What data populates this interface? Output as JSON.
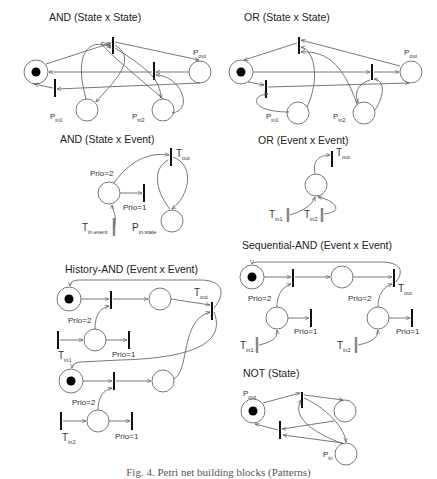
{
  "figure": {
    "caption": "Fig. 4. Petri net building blocks (Patterns)",
    "colors": {
      "stroke": "#555555",
      "token": "#000000",
      "background": "#ffffff"
    }
  },
  "panels": {
    "and_state_state": {
      "title": "AND (State x State)",
      "labels": {
        "p_out": "P",
        "p_out_sub": "out",
        "p_in1": "P",
        "p_in1_sub": "in1",
        "p_in2": "P",
        "p_in2_sub": "in2"
      }
    },
    "or_state_state": {
      "title": "OR (State x State)",
      "labels": {
        "p_out": "P",
        "p_out_sub": "out",
        "p_in1": "P",
        "p_in1_sub": "in1",
        "p_in2": "P",
        "p_in2_sub": "in2"
      }
    },
    "and_state_event": {
      "title": "AND (State x Event)",
      "labels": {
        "t_out": "T",
        "t_out_sub": "out",
        "prio2": "Prio=2",
        "prio1": "Prio=1",
        "t_in_event": "T",
        "t_in_event_sub": "in.event",
        "p_in_state": "P",
        "p_in_state_sub": "in.state"
      }
    },
    "or_event_event": {
      "title": "OR (Event x Event)",
      "labels": {
        "t_out": "T",
        "t_out_sub": "out",
        "t_in1": "T",
        "t_in1_sub": "in1",
        "t_in2": "T",
        "t_in2_sub": "in2"
      }
    },
    "history_and": {
      "title": "History-AND (Event x Event)",
      "labels": {
        "t_out": "T",
        "t_out_sub": "out",
        "prio2_a": "Prio=2",
        "prio1_a": "Prio=1",
        "t_in1": "T",
        "t_in1_sub": "in1",
        "prio2_b": "Prio=2",
        "prio1_b": "Prio=1",
        "t_in2": "T",
        "t_in2_sub": "in2"
      }
    },
    "sequential_and": {
      "title": "Sequential-AND (Event x Event)",
      "labels": {
        "t_out": "T",
        "t_out_sub": "out",
        "prio2_a": "Prio=2",
        "prio1_a": "Prio=1",
        "t_in1": "T",
        "t_in1_sub": "in1",
        "prio2_b": "Prio=2",
        "prio1_b": "Prio=1",
        "t_in2": "T",
        "t_in2_sub": "in2"
      }
    },
    "not_state": {
      "title": "NOT (State)",
      "labels": {
        "p_out": "P",
        "p_out_sub": "out",
        "p_in": "P",
        "p_in_sub": "in"
      }
    }
  }
}
